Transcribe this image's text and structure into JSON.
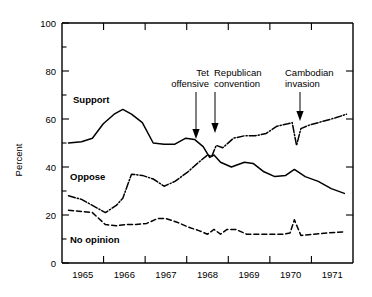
{
  "chart_data": {
    "type": "line",
    "title": "",
    "xlabel": "",
    "ylabel": "Percent",
    "ylim": [
      0,
      100
    ],
    "xlim": [
      1964.6,
      1971.3
    ],
    "grid": false,
    "legend": "inline-labels",
    "y_ticks": [
      0,
      20,
      40,
      60,
      80,
      100
    ],
    "y_ticks_minor": [
      10,
      30,
      50,
      70,
      90
    ],
    "x_tick_labels": [
      "1965",
      "1966",
      "1967",
      "1968",
      "1969",
      "1970",
      "1971"
    ],
    "series": [
      {
        "name": "Support",
        "label": "Support",
        "style": "solid",
        "x": [
          1964.75,
          1965.05,
          1965.3,
          1965.55,
          1965.8,
          1966.0,
          1966.2,
          1966.45,
          1966.7,
          1966.95,
          1967.2,
          1967.45,
          1967.65,
          1967.85,
          1968.0,
          1968.1,
          1968.25,
          1968.5,
          1968.8,
          1969.0,
          1969.25,
          1969.5,
          1969.75,
          1969.95,
          1970.2,
          1970.5,
          1970.8,
          1971.1
        ],
        "values": [
          50,
          50.5,
          52,
          58,
          62,
          64,
          62,
          58.5,
          50,
          49.5,
          49.5,
          52,
          51.5,
          48.5,
          44,
          45,
          42,
          40,
          42,
          41.5,
          38,
          36,
          36.5,
          39,
          36,
          34,
          31,
          29
        ]
      },
      {
        "name": "Oppose",
        "label": "Oppose",
        "style": "dash-dot",
        "x": [
          1964.75,
          1965.05,
          1965.3,
          1965.6,
          1965.85,
          1966.0,
          1966.2,
          1966.45,
          1966.7,
          1966.95,
          1967.2,
          1967.5,
          1967.75,
          1967.95,
          1968.05,
          1968.15,
          1968.3,
          1968.55,
          1968.8,
          1969.05,
          1969.3,
          1969.55,
          1969.8,
          1969.9,
          1970.0,
          1970.1,
          1970.3,
          1970.6,
          1970.9,
          1971.15
        ],
        "values": [
          28,
          26.5,
          24,
          21,
          24,
          27,
          37,
          36.5,
          35,
          32,
          34,
          38,
          42,
          45,
          44.5,
          49,
          48,
          52,
          53,
          53,
          54,
          57,
          58,
          58.5,
          49,
          56,
          57.5,
          59,
          60.5,
          62
        ]
      },
      {
        "name": "No opinion",
        "label": "No opinion",
        "style": "dashed",
        "x": [
          1964.75,
          1965.05,
          1965.3,
          1965.6,
          1965.85,
          1966.05,
          1966.3,
          1966.55,
          1966.8,
          1967.0,
          1967.25,
          1967.5,
          1967.75,
          1967.95,
          1968.1,
          1968.25,
          1968.4,
          1968.6,
          1968.85,
          1969.1,
          1969.4,
          1969.7,
          1969.85,
          1969.95,
          1970.1,
          1970.4,
          1970.7,
          1971.1
        ],
        "values": [
          22,
          21.5,
          21,
          16,
          15.5,
          16,
          16,
          16.5,
          18.5,
          18.5,
          17,
          15,
          13.5,
          12,
          14,
          12,
          14,
          14,
          12,
          12,
          12,
          12,
          12.5,
          18,
          11.5,
          12,
          12.5,
          13
        ]
      }
    ],
    "annotations": [
      {
        "label_line1": "Tet",
        "label_line2": "offensive",
        "x": 1967.95,
        "y_target": 45
      },
      {
        "label_line1": "Republican",
        "label_line2": "convention",
        "x": 1968.2,
        "y_target": 49
      },
      {
        "label_line1": "Cambodian",
        "label_line2": "invasion",
        "x": 1969.98,
        "y_target": 58
      }
    ],
    "colors": {
      "axis": "#000000",
      "support": "#000000",
      "oppose": "#000000",
      "no_opinion": "#000000",
      "background": "#ffffff"
    }
  }
}
